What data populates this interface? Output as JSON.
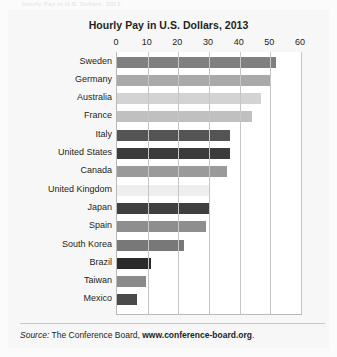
{
  "top_note": "Hourly Pay in U.S. Dollars, 2013",
  "chart_data": {
    "type": "bar",
    "orientation": "horizontal",
    "title": "Hourly Pay in U.S. Dollars, 2013",
    "xlabel": "",
    "ylabel": "",
    "xlim": [
      0,
      60
    ],
    "ticks": [
      0,
      10,
      20,
      30,
      40,
      50,
      60
    ],
    "grid": true,
    "legend": null,
    "categories": [
      "Sweden",
      "Germany",
      "Australia",
      "France",
      "Italy",
      "United States",
      "Canada",
      "United Kingdom",
      "Japan",
      "Spain",
      "South Korea",
      "Brazil",
      "Taiwan",
      "Mexico"
    ],
    "values": [
      52,
      50,
      47,
      44,
      37,
      37,
      36,
      30,
      30,
      29,
      22,
      11,
      9.5,
      6.5
    ],
    "bar_colors": [
      "#808080",
      "#a9a9a9",
      "#d3d3d3",
      "#c0c0c0",
      "#545454",
      "#3b3b3b",
      "#9a9a9a",
      "#eeeeee",
      "#3f3f3f",
      "#8e8e8e",
      "#787878",
      "#2b2b2b",
      "#8a8a8a",
      "#4a4a4a"
    ]
  },
  "source": {
    "lead": "Source:",
    "body": "The Conference Board,",
    "url": "www.conference-board.org",
    "period": "."
  }
}
